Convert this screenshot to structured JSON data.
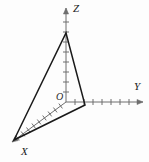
{
  "figure": {
    "background_color": "#fdfdfd",
    "axis_color": "#6e6e6e",
    "triangle_color": "#1a1a1a",
    "label_color": "#1a1a1a",
    "width": 149,
    "height": 162
  },
  "origin": {
    "label": "O",
    "x": 66,
    "y": 102,
    "label_x": 56,
    "label_y": 100
  },
  "axes": [
    {
      "name": "z-axis",
      "label": "Z",
      "label_x": 73,
      "label_y": 12,
      "direction": "up",
      "start_x": 66,
      "start_y": 102,
      "end_x": 66,
      "end_y": 8,
      "tick_count": 9,
      "tick_spacing": 10,
      "tick_half_length": 3,
      "arrow": true
    },
    {
      "name": "y-axis",
      "label": "Y",
      "label_x": 134,
      "label_y": 90,
      "direction": "right",
      "start_x": 66,
      "start_y": 102,
      "end_x": 143,
      "end_y": 102,
      "tick_count": 7,
      "tick_spacing": 9,
      "tick_half_length": 3,
      "arrow": true
    },
    {
      "name": "x-axis",
      "label": "X",
      "label_x": 21,
      "label_y": 155,
      "direction": "down-left",
      "start_x": 66,
      "start_y": 102,
      "end_x": 12,
      "end_y": 142,
      "tick_count": 9,
      "tick_spacing": 6.7,
      "tick_half_length": 3,
      "arrow": true
    }
  ],
  "triangle": {
    "name": "triangle",
    "stroke_width": 1.5,
    "fill": "none",
    "vertices": [
      {
        "name": "apex-on-z-axis",
        "x": 66,
        "y": 33
      },
      {
        "name": "vertex-on-y-axis",
        "x": 85,
        "y": 105
      },
      {
        "name": "vertex-on-x-axis-end",
        "x": 14,
        "y": 140
      }
    ]
  },
  "labels": {
    "z": "Z",
    "y": "Y",
    "x": "X",
    "origin": "O"
  }
}
